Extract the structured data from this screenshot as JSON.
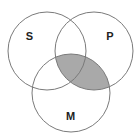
{
  "diagram": {
    "type": "venn-3",
    "circles": [
      {
        "id": "S",
        "label": "S",
        "cx": 47,
        "cy": 51,
        "r": 39,
        "label_x": 29.5,
        "label_y": 40
      },
      {
        "id": "P",
        "label": "P",
        "cx": 94,
        "cy": 51,
        "r": 39,
        "label_x": 110,
        "label_y": 40
      },
      {
        "id": "M",
        "label": "M",
        "cx": 71,
        "cy": 93,
        "r": 39,
        "label_x": 70.5,
        "label_y": 120
      }
    ],
    "shaded_region": "P ∩ M",
    "colors": {
      "background": "#ffffff",
      "stroke": "#7a7a7a",
      "shade": "#a9a9a9",
      "label": "#222222"
    }
  }
}
